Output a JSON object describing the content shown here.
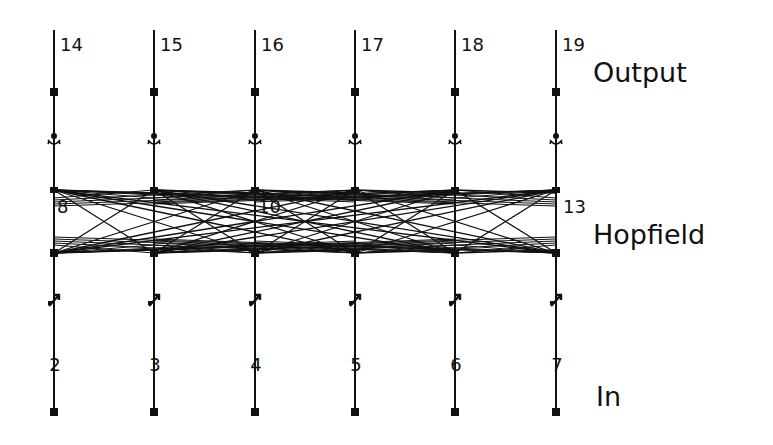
{
  "diagram": {
    "type": "neural-network",
    "columns_x": [
      54,
      154,
      255,
      355,
      455,
      556
    ],
    "layers": {
      "output": {
        "label": "Output",
        "units": [
          "14",
          "15",
          "16",
          "17",
          "18",
          "19"
        ]
      },
      "hopfield": {
        "label": "Hopfield",
        "units": [
          "8",
          "9",
          "10",
          "11",
          "12",
          "13"
        ],
        "visible_unit_labels": [
          "8",
          "10",
          "13"
        ]
      },
      "input": {
        "label": "In",
        "units": [
          "2",
          "3",
          "4",
          "5",
          "6",
          "7"
        ]
      }
    },
    "connections": {
      "input_to_hopfield": "one-to-one",
      "hopfield_to_hopfield": "fully-connected",
      "hopfield_to_output": "one-to-one"
    }
  },
  "labels": {
    "out_0": "14",
    "out_1": "15",
    "out_2": "16",
    "out_3": "17",
    "out_4": "18",
    "out_5": "19",
    "hop_0": "8",
    "hop_2": "10",
    "hop_5": "13",
    "in_0": "2",
    "in_1": "3",
    "in_2": "4",
    "in_3": "5",
    "in_4": "6",
    "in_5": "7",
    "output_layer": "Output",
    "hopfield_layer": "Hopfield",
    "input_layer": "In"
  },
  "colors": {
    "line": "#111111",
    "background": "#ffffff"
  }
}
